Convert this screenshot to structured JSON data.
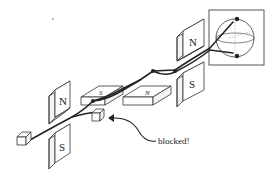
{
  "diagram": {
    "stray_mark": "'",
    "magnets": [
      {
        "id": "sg1-north",
        "label": "N",
        "orientation": "vertical"
      },
      {
        "id": "sg1-south",
        "label": "S",
        "orientation": "vertical"
      },
      {
        "id": "sg2-south",
        "label": "S",
        "orientation": "horizontal"
      },
      {
        "id": "sg2-north",
        "label": "N",
        "orientation": "horizontal"
      },
      {
        "id": "sg3-north",
        "label": "N",
        "orientation": "vertical"
      },
      {
        "id": "sg3-south",
        "label": "S",
        "orientation": "vertical"
      }
    ],
    "source": {
      "name": "particle-source"
    },
    "blocker": {
      "name": "beam-blocker"
    },
    "annotation": {
      "text": "blocked!"
    },
    "bloch_sphere": {
      "name": "bloch-sphere-inset"
    },
    "colors": {
      "ink": "#222222",
      "background": "#ffffff",
      "face": "#ffffff",
      "side": "#f4f4f4"
    }
  }
}
